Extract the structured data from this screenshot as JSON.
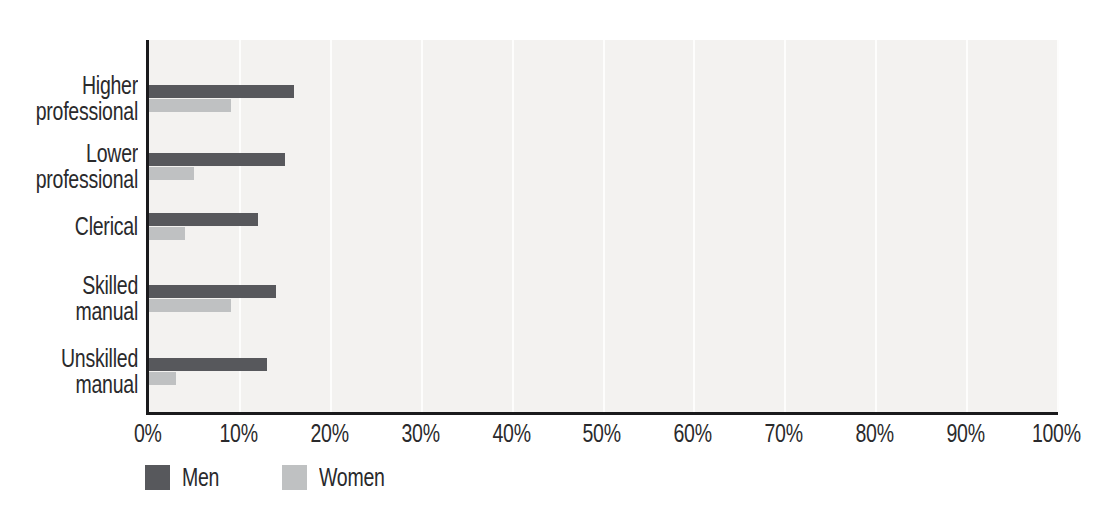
{
  "colors": {
    "background": "#ffffff",
    "plot_background": "#f3f2f0",
    "gridline": "#fdfdfc",
    "axis": "#1a1a1c",
    "text": "#2a2a2c"
  },
  "chart_data": {
    "type": "bar",
    "orientation": "horizontal",
    "title": "",
    "xlabel": "",
    "ylabel": "",
    "categories": [
      "Higher professional",
      "Lower professional",
      "Clerical",
      "Skilled manual",
      "Unskilled manual"
    ],
    "series": [
      {
        "name": "Men",
        "color": "#57585c",
        "values": [
          16,
          15,
          12,
          14,
          13
        ]
      },
      {
        "name": "Women",
        "color": "#bfc1c2",
        "values": [
          9,
          5,
          4,
          9,
          3
        ]
      }
    ],
    "x_ticks": [
      "0%",
      "10%",
      "20%",
      "30%",
      "40%",
      "50%",
      "60%",
      "70%",
      "80%",
      "90%",
      "100%"
    ],
    "xlim": [
      0,
      100
    ],
    "grid": true,
    "gridlines": "vertical white lines every 10%",
    "legend_position": "bottom-left",
    "units": "percent"
  }
}
